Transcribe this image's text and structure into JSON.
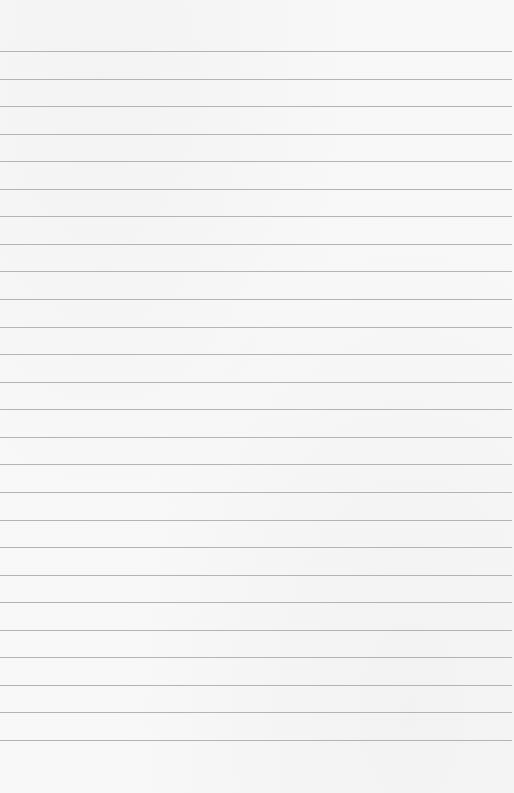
{
  "page": {
    "type": "lined-paper",
    "background_color": "#f8f8f8",
    "line_color": "#b4b4b4",
    "line_count": 26,
    "first_line_y": 51,
    "line_spacing": 27.56,
    "text": ""
  }
}
